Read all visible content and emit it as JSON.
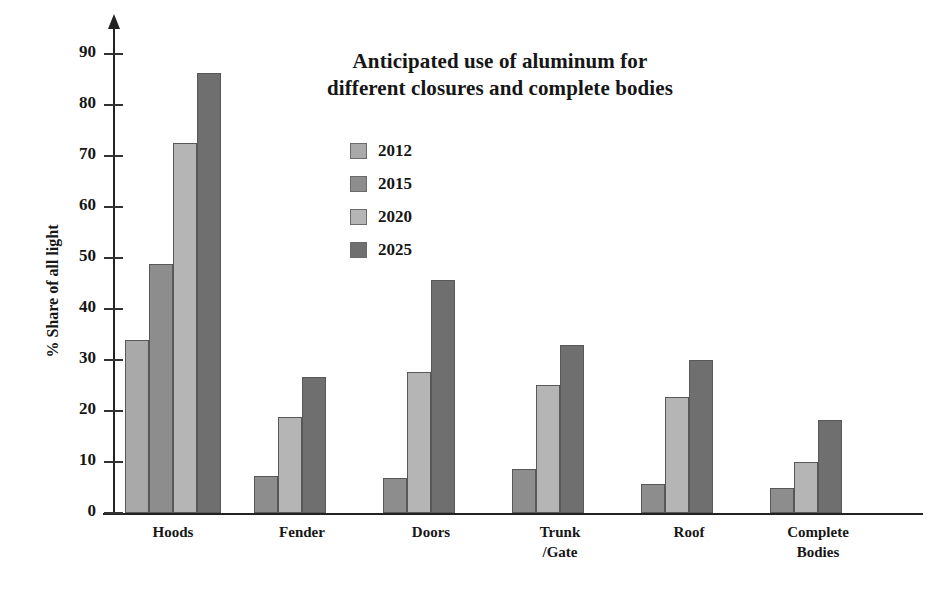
{
  "chart_data": {
    "type": "bar",
    "title": "Anticipated use of aluminum for different closures and complete bodies",
    "title_lines": [
      "Anticipated use of aluminum for",
      "different closures and complete bodies"
    ],
    "xlabel": "",
    "ylabel": "% Share of all light",
    "ylim": [
      0,
      90
    ],
    "ytick_labels": [
      "0",
      "10",
      "20",
      "30",
      "40",
      "50",
      "60",
      "70",
      "80",
      "90"
    ],
    "yticks": [
      0,
      10,
      20,
      30,
      40,
      50,
      60,
      70,
      80,
      90
    ],
    "grid": false,
    "legend_position": "upper-center",
    "categories": [
      "Hoods",
      "Fender",
      "Doors",
      "Trunk /Gate",
      "Roof",
      "Complete Bodies"
    ],
    "category_lines": [
      [
        "Hoods"
      ],
      [
        "Fender"
      ],
      [
        "Doors"
      ],
      [
        "Trunk",
        "/Gate"
      ],
      [
        "Roof"
      ],
      [
        "Complete",
        "Bodies"
      ]
    ],
    "series": [
      {
        "name": "2012",
        "color": "#a9a9a9",
        "values": [
          34.0,
          0,
          0,
          0,
          0,
          0
        ]
      },
      {
        "name": "2015",
        "color": "#8d8d8d",
        "values": [
          48.8,
          7.3,
          6.9,
          8.6,
          5.6,
          4.9
        ]
      },
      {
        "name": "2020",
        "color": "#b5b5b5",
        "values": [
          72.5,
          18.9,
          27.6,
          25.1,
          22.7,
          10.0
        ]
      },
      {
        "name": "2025",
        "color": "#6f6f6f",
        "values": [
          86.2,
          26.7,
          45.6,
          32.9,
          30.1,
          18.2
        ]
      }
    ]
  },
  "legend": {
    "items": [
      {
        "label": "2012",
        "color": "#a9a9a9"
      },
      {
        "label": "2015",
        "color": "#8d8d8d"
      },
      {
        "label": "2020",
        "color": "#b5b5b5"
      },
      {
        "label": "2025",
        "color": "#6f6f6f"
      }
    ]
  }
}
